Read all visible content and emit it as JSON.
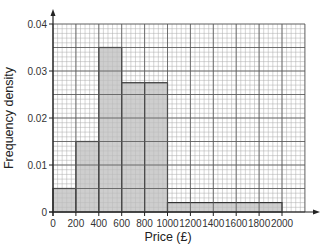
{
  "chart_data": {
    "type": "bar",
    "subtype": "histogram",
    "title": "",
    "xlabel": "Price (£)",
    "ylabel": "Frequency density",
    "xlim": [
      0,
      2000
    ],
    "ylim": [
      0,
      0.04
    ],
    "x_ticks": [
      "0",
      "200",
      "400",
      "600",
      "800",
      "1000",
      "1200",
      "1400",
      "1600",
      "1800",
      "2000"
    ],
    "y_ticks": [
      "0",
      "0.01",
      "0.02",
      "0.03",
      "0.04"
    ],
    "grid": true,
    "bins": [
      {
        "from": 0,
        "to": 200,
        "density": 0.005
      },
      {
        "from": 200,
        "to": 400,
        "density": 0.015
      },
      {
        "from": 400,
        "to": 600,
        "density": 0.035
      },
      {
        "from": 600,
        "to": 800,
        "density": 0.0275
      },
      {
        "from": 800,
        "to": 1000,
        "density": 0.0275
      },
      {
        "from": 1000,
        "to": 2000,
        "density": 0.002,
        "note": "approximate; read from pixels as ~0.0019"
      }
    ],
    "categories": [
      "0-200",
      "200-400",
      "400-600",
      "600-800",
      "800-1000",
      "1000-2000"
    ],
    "values": [
      0.005,
      0.015,
      0.035,
      0.0275,
      0.0275,
      0.002
    ],
    "colors": {
      "bar_fill": "#bdbdbd",
      "bar_stroke": "#333333",
      "grid_major": "#555555",
      "grid_minor": "#aaaaaa"
    }
  }
}
